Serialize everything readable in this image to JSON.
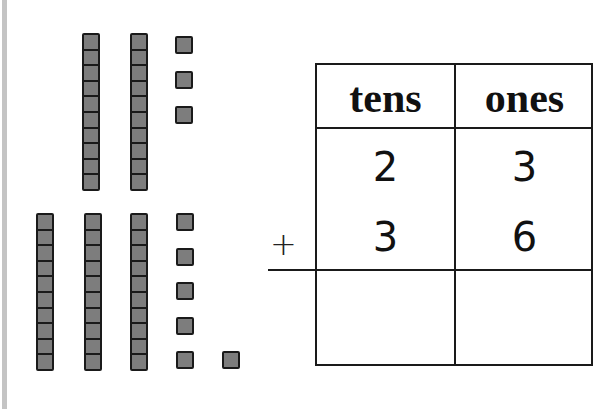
{
  "problem": {
    "operator": "+",
    "table": {
      "headers": [
        "tens",
        "ones"
      ],
      "addend1": {
        "tens": "2",
        "ones": "3"
      },
      "addend2": {
        "tens": "3",
        "ones": "6"
      },
      "sum": {
        "tens": "",
        "ones": ""
      }
    }
  },
  "base_ten_blocks": {
    "top_group": {
      "tens_rods": 2,
      "ones_units": 3,
      "represents": 23
    },
    "bottom_group": {
      "tens_rods": 3,
      "ones_units": 6,
      "represents": 36
    }
  },
  "colors": {
    "block_fill": "#7d7d7d",
    "block_border": "#1a1a1a",
    "left_bar": "#c4c4c4"
  }
}
